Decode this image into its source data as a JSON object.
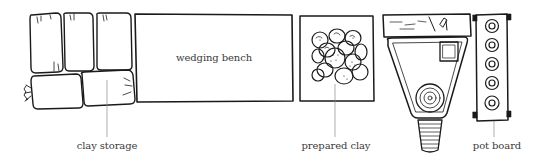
{
  "diagram": {
    "type": "studio layout plan (top view)",
    "items": [
      {
        "id": "clay-storage",
        "label": "clay storage"
      },
      {
        "id": "wedging-bench",
        "label": "wedging bench"
      },
      {
        "id": "prepared-clay",
        "label": "prepared clay"
      },
      {
        "id": "potters-wheel",
        "label": ""
      },
      {
        "id": "pot-board",
        "label": "pot board"
      }
    ],
    "colors": {
      "ink": "#1a1a1a",
      "label_text": "#3a3a3a",
      "leader_line": "#8a8a8a",
      "background": "#ffffff"
    }
  }
}
